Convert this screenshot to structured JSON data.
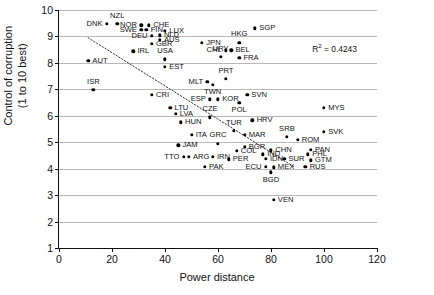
{
  "chart_data": {
    "type": "scatter",
    "title": "",
    "xlabel": "Power distance",
    "ylabel_line1": "Control of corruption",
    "ylabel_line2": "(1 to 10 best)",
    "xlim": [
      0,
      120
    ],
    "ylim": [
      1,
      10
    ],
    "xticks": [
      0,
      20,
      40,
      60,
      80,
      100,
      120
    ],
    "yticks": [
      1,
      2,
      3,
      4,
      5,
      6,
      7,
      8,
      9,
      10
    ],
    "grid": "horizontal",
    "legend": "none",
    "annotations": [
      {
        "name": "r2",
        "text_prefix": "R",
        "text_sup": "2",
        "text_suffix": " = 0.4243",
        "x": 104,
        "y": 8.55
      }
    ],
    "trendline": {
      "style": "dotted",
      "x_start": 11,
      "y_start": 8.95,
      "x_end": 89,
      "y_end": 4.05,
      "r_squared": 0.4243
    },
    "point_label_key": [
      "code",
      "x (power distance)",
      "y (control of corruption)"
    ],
    "points": [
      {
        "code": "DNK",
        "x": 18,
        "y": 9.48,
        "pos": "w"
      },
      {
        "code": "NZL",
        "x": 22,
        "y": 9.48,
        "pos": "n"
      },
      {
        "code": "NOR",
        "x": 31,
        "y": 9.42,
        "pos": "w"
      },
      {
        "code": "SWE",
        "x": 31,
        "y": 9.24,
        "pos": "w"
      },
      {
        "code": "CHE",
        "x": 34,
        "y": 9.42,
        "pos": "e"
      },
      {
        "code": "FIN",
        "x": 33,
        "y": 9.26,
        "pos": "e"
      },
      {
        "code": "LUX",
        "x": 40,
        "y": 9.22,
        "pos": "e"
      },
      {
        "code": "DEU",
        "x": 35,
        "y": 9.02,
        "pos": "w"
      },
      {
        "code": "NLD",
        "x": 38,
        "y": 9.05,
        "pos": "e"
      },
      {
        "code": "AUS",
        "x": 38,
        "y": 8.88,
        "pos": "e"
      },
      {
        "code": "GBR",
        "x": 35,
        "y": 8.72,
        "pos": "e"
      },
      {
        "code": "IRL",
        "x": 28,
        "y": 8.44,
        "pos": "e"
      },
      {
        "code": "USA",
        "x": 40,
        "y": 8.13,
        "pos": "n"
      },
      {
        "code": "EST",
        "x": 40,
        "y": 7.86,
        "pos": "e"
      },
      {
        "code": "AUT",
        "x": 11,
        "y": 8.08,
        "pos": "e"
      },
      {
        "code": "ISR",
        "x": 13,
        "y": 6.98,
        "pos": "n"
      },
      {
        "code": "SGP",
        "x": 74,
        "y": 9.31,
        "pos": "e"
      },
      {
        "code": "JPN",
        "x": 54,
        "y": 8.77,
        "pos": "e"
      },
      {
        "code": "HKG",
        "x": 68,
        "y": 8.77,
        "pos": "n"
      },
      {
        "code": "CHL",
        "x": 63,
        "y": 8.48,
        "pos": "w"
      },
      {
        "code": "BEL",
        "x": 65,
        "y": 8.48,
        "pos": "e"
      },
      {
        "code": "URY",
        "x": 61,
        "y": 8.22,
        "pos": "n"
      },
      {
        "code": "FRA",
        "x": 68,
        "y": 8.2,
        "pos": "e"
      },
      {
        "code": "MLT",
        "x": 56,
        "y": 7.28,
        "pos": "w"
      },
      {
        "code": "PRT",
        "x": 63,
        "y": 7.4,
        "pos": "n"
      },
      {
        "code": "TWN",
        "x": 58,
        "y": 7.17,
        "pos": "s"
      },
      {
        "code": "CRI",
        "x": 35,
        "y": 6.8,
        "pos": "e"
      },
      {
        "code": "SVN",
        "x": 71,
        "y": 6.8,
        "pos": "e"
      },
      {
        "code": "KOR",
        "x": 60,
        "y": 6.62,
        "pos": "e"
      },
      {
        "code": "ESP",
        "x": 57,
        "y": 6.62,
        "pos": "w"
      },
      {
        "code": "POL",
        "x": 68,
        "y": 6.48,
        "pos": "s"
      },
      {
        "code": "LTU",
        "x": 42,
        "y": 6.3,
        "pos": "e"
      },
      {
        "code": "LVA",
        "x": 44,
        "y": 6.08,
        "pos": "e"
      },
      {
        "code": "MYS",
        "x": 100,
        "y": 6.31,
        "pos": "e"
      },
      {
        "code": "CZE",
        "x": 57,
        "y": 5.94,
        "pos": "n"
      },
      {
        "code": "HUN",
        "x": 46,
        "y": 5.76,
        "pos": "e"
      },
      {
        "code": "HRV",
        "x": 73,
        "y": 5.83,
        "pos": "e"
      },
      {
        "code": "SVK",
        "x": 100,
        "y": 5.4,
        "pos": "e"
      },
      {
        "code": "ITA",
        "x": 50,
        "y": 5.28,
        "pos": "e"
      },
      {
        "code": "TUR",
        "x": 66,
        "y": 5.43,
        "pos": "n"
      },
      {
        "code": "MAR",
        "x": 70,
        "y": 5.28,
        "pos": "e"
      },
      {
        "code": "SRB",
        "x": 86,
        "y": 5.2,
        "pos": "n"
      },
      {
        "code": "ROM",
        "x": 90,
        "y": 5.1,
        "pos": "e"
      },
      {
        "code": "JAM",
        "x": 45,
        "y": 4.88,
        "pos": "e"
      },
      {
        "code": "GRC",
        "x": 60,
        "y": 4.95,
        "pos": "n"
      },
      {
        "code": "BGR",
        "x": 70,
        "y": 4.82,
        "pos": "e"
      },
      {
        "code": "COL",
        "x": 67,
        "y": 4.68,
        "pos": "e"
      },
      {
        "code": "CHN",
        "x": 80,
        "y": 4.7,
        "pos": "e"
      },
      {
        "code": "PAN",
        "x": 95,
        "y": 4.72,
        "pos": "e"
      },
      {
        "code": "PHL",
        "x": 94,
        "y": 4.55,
        "pos": "e"
      },
      {
        "code": "IND",
        "x": 77,
        "y": 4.55,
        "pos": "e"
      },
      {
        "code": "TTO",
        "x": 47,
        "y": 4.44,
        "pos": "w"
      },
      {
        "code": "ARG",
        "x": 49,
        "y": 4.44,
        "pos": "e"
      },
      {
        "code": "IRN",
        "x": 58,
        "y": 4.44,
        "pos": "e"
      },
      {
        "code": "PER",
        "x": 64,
        "y": 4.36,
        "pos": "e"
      },
      {
        "code": "IDN",
        "x": 78,
        "y": 4.38,
        "pos": "e"
      },
      {
        "code": "SUR",
        "x": 85,
        "y": 4.38,
        "pos": "e"
      },
      {
        "code": "GTM",
        "x": 95,
        "y": 4.32,
        "pos": "e"
      },
      {
        "code": "PAK",
        "x": 55,
        "y": 4.06,
        "pos": "e"
      },
      {
        "code": "ECU",
        "x": 78,
        "y": 4.08,
        "pos": "w"
      },
      {
        "code": "MEX",
        "x": 81,
        "y": 4.05,
        "pos": "e"
      },
      {
        "code": "RUS",
        "x": 93,
        "y": 4.08,
        "pos": "e"
      },
      {
        "code": "BGD",
        "x": 80,
        "y": 3.86,
        "pos": "s"
      },
      {
        "code": "VEN",
        "x": 81,
        "y": 2.82,
        "pos": "e"
      }
    ]
  }
}
